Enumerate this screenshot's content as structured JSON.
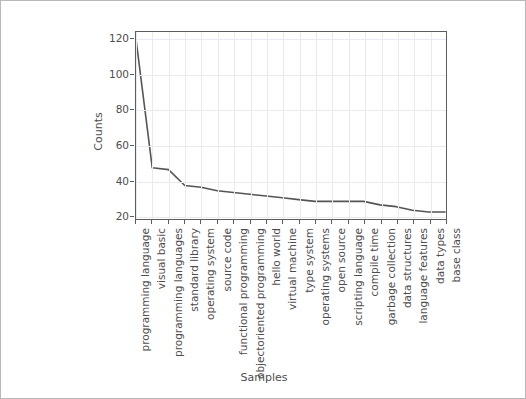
{
  "chart_data": {
    "type": "line",
    "title": "",
    "xlabel": "Samples",
    "ylabel": "Counts",
    "grid": true,
    "legend": null,
    "ylim": [
      18,
      124
    ],
    "yticks": [
      20,
      40,
      60,
      80,
      100,
      120
    ],
    "categories": [
      "programming language",
      "visual basic",
      "programming languages",
      "standard library",
      "operating system",
      "source code",
      "functional programming",
      "objectoriented programming",
      "hello world",
      "virtual machine",
      "type system",
      "operating systems",
      "open source",
      "scripting language",
      "compile time",
      "garbage collection",
      "data structures",
      "language features",
      "data types",
      "base class"
    ],
    "values": [
      120,
      47,
      46,
      37,
      36,
      34,
      33,
      32,
      31,
      30,
      29,
      28,
      28,
      28,
      28,
      26,
      25,
      23,
      22,
      22
    ],
    "colors": {
      "line": "#555555",
      "grid": "#e9e9f2",
      "axis": "#5c5c5c",
      "text": "#4d4d4d",
      "background": "#ffffff",
      "figure_border": "#b8b8b8"
    }
  }
}
